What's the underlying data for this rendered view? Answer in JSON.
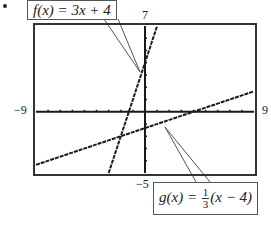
{
  "chart_data": {
    "type": "line",
    "title": "",
    "xlabel": "",
    "ylabel": "",
    "xlim": [
      -9,
      9
    ],
    "ylim": [
      -5,
      7
    ],
    "grid": false,
    "tick_labels": {
      "xmin": "-9",
      "xmax": "9",
      "ymin": "-5",
      "ymax": "7"
    },
    "series": [
      {
        "name": "f(x) = 3x + 4",
        "slope": 3,
        "intercept": 4,
        "points": [
          [
            -3,
            -5
          ],
          [
            1,
            7
          ]
        ]
      },
      {
        "name": "g(x) = 1/3(x - 4)",
        "slope": 0.3333,
        "intercept": -1.3333,
        "points": [
          [
            -9,
            -4.333
          ],
          [
            9,
            1.667
          ]
        ]
      }
    ],
    "annotations": [
      {
        "text": "f(x) = 3x + 4",
        "points_to": "f"
      },
      {
        "text": "g(x) = 1/3(x - 4)",
        "points_to": "g"
      }
    ]
  },
  "labels": {
    "ymax": "7",
    "ymin": "−5",
    "xmin": "−9",
    "xmax": "9",
    "f_prefix": "f(x) = 3x + 4",
    "g_prefix": "g(x) =",
    "g_num": "1",
    "g_den": "3",
    "g_suffix": "(x − 4)"
  },
  "colors": {
    "frame": "#333333",
    "line": "#1a1a1a",
    "callout_border": "#555555"
  }
}
